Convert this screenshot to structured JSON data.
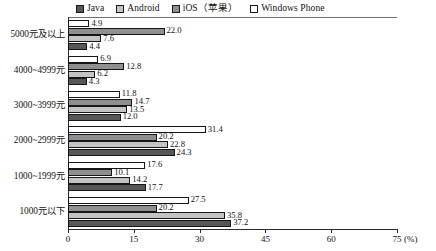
{
  "chart_data": {
    "type": "bar",
    "orientation": "horizontal",
    "grouped": true,
    "title": "",
    "subtitle": "",
    "xlabel": "",
    "ylabel": "",
    "unit_label": "(%)",
    "xlim": [
      0,
      75
    ],
    "xticks": [
      0,
      15,
      30,
      45,
      60,
      75
    ],
    "xtick_labels": [
      "0",
      "15",
      "30",
      "45",
      "60",
      "75"
    ],
    "grid": false,
    "legend_position": "top",
    "categories": [
      "5000元及以上",
      "4000~4999元",
      "3000~3999元",
      "2000~2999元",
      "1000~1999元",
      "1000元以下"
    ],
    "series": [
      {
        "name": "Java",
        "color": "#575757",
        "values": [
          4.4,
          4.3,
          12.0,
          24.3,
          17.7,
          37.2
        ],
        "value_labels": [
          "4.4",
          "4.3",
          "12.0",
          "24.3",
          "17.7",
          "37.2"
        ]
      },
      {
        "name": "Android",
        "color": "#c3c3c3",
        "values": [
          7.6,
          6.2,
          13.5,
          22.8,
          14.2,
          35.8
        ],
        "value_labels": [
          "7.6",
          "6.2",
          "13.5",
          "22.8",
          "14.2",
          "35.8"
        ]
      },
      {
        "name": "iOS（苹果）",
        "color": "#8f8f8f",
        "values": [
          22.0,
          12.8,
          14.7,
          20.2,
          10.1,
          20.2
        ],
        "value_labels": [
          "22.0",
          "12.8",
          "14.7",
          "20.2",
          "10.1",
          "20.2"
        ]
      },
      {
        "name": "Windows Phone",
        "color": "#ffffff",
        "values": [
          4.9,
          6.9,
          11.8,
          31.4,
          17.6,
          27.5
        ],
        "value_labels": [
          "4.9",
          "6.9",
          "11.8",
          "31.4",
          "17.6",
          "27.5"
        ]
      }
    ]
  },
  "legend": {
    "entries": [
      {
        "label": "Java",
        "color": "#575757"
      },
      {
        "label": "Android",
        "color": "#c3c3c3"
      },
      {
        "label": "iOS（苹果）",
        "color": "#8f8f8f"
      },
      {
        "label": "Windows Phone",
        "color": "#ffffff"
      }
    ]
  },
  "axis": {
    "x_unit": "(%)",
    "x_tick_labels": [
      "0",
      "15",
      "30",
      "45",
      "60",
      "75"
    ]
  }
}
